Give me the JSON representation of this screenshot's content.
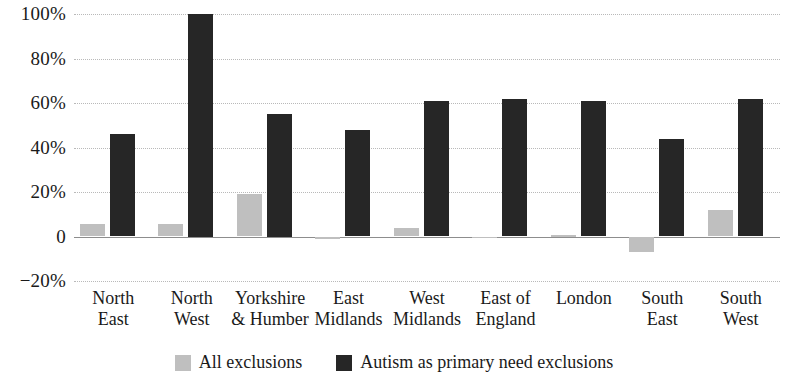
{
  "chart_data": {
    "type": "bar",
    "title": "",
    "subtitle": "",
    "xlabel": "",
    "ylabel": "",
    "ylim": [
      -20,
      100
    ],
    "ytick_labels": [
      "100%",
      "80%",
      "60%",
      "40%",
      "20%",
      "0",
      "-20%"
    ],
    "ytick_values": [
      100,
      80,
      60,
      40,
      20,
      0,
      -20
    ],
    "grid": true,
    "legend_position": "bottom",
    "categories": [
      "North East",
      "North West",
      "Yorkshire & Humber",
      "East Midlands",
      "West Midlands",
      "East of England",
      "London",
      "South East",
      "South West"
    ],
    "category_label_lines": [
      [
        "North",
        "East"
      ],
      [
        "North",
        "West"
      ],
      [
        "Yorkshire",
        "& Humber"
      ],
      [
        "East",
        "Midlands"
      ],
      [
        "West",
        "Midlands"
      ],
      [
        "East of",
        "England"
      ],
      [
        "London",
        ""
      ],
      [
        "South",
        "East"
      ],
      [
        "South",
        "West"
      ]
    ],
    "series": [
      {
        "name": "All exclusions",
        "color": "#bfbfbf",
        "values": [
          5.5,
          5.5,
          19,
          -1,
          4,
          -0.5,
          0.5,
          -7,
          12
        ]
      },
      {
        "name": "Autism as primary need exclusions",
        "color": "#262626",
        "values": [
          46,
          100,
          55,
          48,
          61,
          62,
          61,
          44,
          62
        ]
      }
    ]
  },
  "legend": {
    "items": [
      {
        "label": "All exclusions",
        "color": "#bfbfbf"
      },
      {
        "label": "Autism as primary need exclusions",
        "color": "#262626"
      }
    ]
  }
}
